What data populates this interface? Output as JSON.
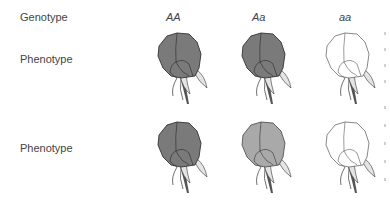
{
  "labels": {
    "genotype": "Genotype",
    "phenotype_row1": "Phenotype",
    "phenotype_row2": "Phenotype"
  },
  "genotypes": [
    "AA",
    "Aa",
    "aa"
  ],
  "rows": [
    {
      "name": "Phenotype (complete dominance)",
      "flowers": [
        {
          "genotype": "AA",
          "fill": "#7a7a7a",
          "shade": "dark"
        },
        {
          "genotype": "Aa",
          "fill": "#7a7a7a",
          "shade": "dark"
        },
        {
          "genotype": "aa",
          "fill": "#ffffff",
          "shade": "white"
        }
      ]
    },
    {
      "name": "Phenotype (incomplete dominance)",
      "flowers": [
        {
          "genotype": "AA",
          "fill": "#7a7a7a",
          "shade": "dark"
        },
        {
          "genotype": "Aa",
          "fill": "#a9a9a9",
          "shade": "light"
        },
        {
          "genotype": "aa",
          "fill": "#ffffff",
          "shade": "white"
        }
      ]
    }
  ],
  "colors": {
    "text": "#444444",
    "outline": "#333333",
    "sepal": "#e4e4e4",
    "stem": "#555555"
  }
}
